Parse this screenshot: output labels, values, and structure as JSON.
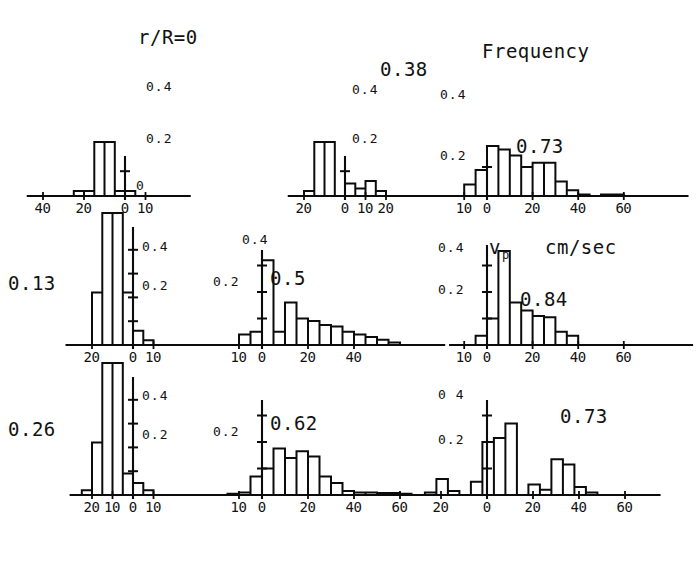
{
  "figure": {
    "title_top": "r/R=0",
    "frequency_label": "Frequency",
    "axis_symbol": "v",
    "axis_symbol_sub": "p",
    "axis_units": "cm/sec"
  },
  "chart_data": {
    "type": "bar",
    "xlabel": "v_p  cm/sec",
    "ylabel": "Frequency",
    "ylim": [
      0,
      0.5
    ],
    "grid": false,
    "legend": "none",
    "panels": [
      {
        "id": "panel-1",
        "label": "r/R=0",
        "row": 0,
        "col": 0,
        "xticks": [
          "40",
          "20",
          "0",
          "10"
        ],
        "xtick_values": [
          -40,
          -20,
          0,
          10
        ],
        "yticks": [
          "0",
          "0.2",
          "0.4"
        ],
        "ytick_values": [
          0,
          0.2,
          0.4
        ],
        "xlim": [
          -45,
          15
        ],
        "bin_width": 5,
        "bins_left": [
          -40,
          -35,
          -30,
          -25,
          -20,
          -15,
          -10,
          -5,
          0,
          5,
          10
        ],
        "values": [
          0.0,
          0.0,
          0.0,
          0.02,
          0.02,
          0.72,
          0.55,
          0.02,
          0.02,
          0.0,
          0.0
        ]
      },
      {
        "id": "panel-2",
        "label": "0.38",
        "row": 0,
        "col": 1,
        "xticks": [
          "20",
          "0",
          "10",
          "20"
        ],
        "xtick_values": [
          -20,
          0,
          10,
          20
        ],
        "yticks": [
          "0.2",
          "0.4"
        ],
        "ytick_values": [
          0.2,
          0.4
        ],
        "xlim": [
          -25,
          24
        ],
        "bin_width": 5,
        "bins_left": [
          -25,
          -20,
          -15,
          -10,
          -5,
          0,
          5,
          10,
          15,
          20
        ],
        "values": [
          0.0,
          0.02,
          0.56,
          0.4,
          0.0,
          0.05,
          0.03,
          0.06,
          0.02,
          0.0
        ]
      },
      {
        "id": "panel-3",
        "label": "0.73",
        "row": 0,
        "col": 2,
        "title": "Frequency",
        "xticks": [
          "10",
          "0",
          "20",
          "40",
          "60"
        ],
        "xtick_values": [
          -10,
          0,
          20,
          40,
          60
        ],
        "yticks": [
          "0.2",
          "0.4"
        ],
        "ytick_values": [
          0.2,
          0.4
        ],
        "xlim": [
          -16,
          78
        ],
        "bin_width": 5,
        "bins_left": [
          -15,
          -10,
          -5,
          0,
          5,
          10,
          15,
          20,
          25,
          30,
          35,
          40,
          45,
          50,
          55,
          60,
          65,
          70
        ],
        "values": [
          0.0,
          0.04,
          0.09,
          0.21,
          0.16,
          0.14,
          0.1,
          0.115,
          0.115,
          0.05,
          0.02,
          0.005,
          0.0,
          0.005,
          0.005,
          0.0,
          0.0,
          0.0
        ]
      },
      {
        "id": "panel-4",
        "label": "0.13",
        "row": 1,
        "col": 0,
        "xticks": [
          "20",
          "0",
          "10"
        ],
        "xtick_values": [
          -20,
          0,
          10
        ],
        "yticks": [
          "0.2",
          "0.4"
        ],
        "ytick_values": [
          0.2,
          0.4
        ],
        "xlim": [
          -30,
          14
        ],
        "bin_width": 5,
        "bins_left": [
          -30,
          -25,
          -20,
          -15,
          -10,
          -5,
          0,
          5,
          10
        ],
        "values": [
          0.0,
          0.0,
          0.22,
          0.62,
          0.6,
          0.22,
          0.06,
          0.02,
          0.0
        ]
      },
      {
        "id": "panel-5",
        "label": "0.5",
        "row": 1,
        "col": 1,
        "xticks": [
          "10",
          "0",
          "20",
          "40"
        ],
        "xtick_values": [
          -10,
          0,
          20,
          40
        ],
        "yticks": [
          "0.2",
          "0.4"
        ],
        "ytick_values": [
          0.2,
          0.4
        ],
        "xlim": [
          -16,
          62
        ],
        "bin_width": 5,
        "bins_left": [
          -15,
          -10,
          -5,
          0,
          5,
          10,
          15,
          20,
          25,
          30,
          35,
          40,
          45,
          50,
          55
        ],
        "values": [
          0.0,
          0.04,
          0.05,
          0.32,
          0.05,
          0.16,
          0.1,
          0.09,
          0.075,
          0.07,
          0.05,
          0.04,
          0.03,
          0.02,
          0.01
        ]
      },
      {
        "id": "panel-6",
        "label": "0.84",
        "row": 1,
        "col": 2,
        "xticks": [
          "10",
          "0",
          "20",
          "40",
          "60"
        ],
        "xtick_values": [
          -10,
          0,
          20,
          40,
          60
        ],
        "yticks": [
          "0.2",
          "0.4"
        ],
        "ytick_values": [
          0.2,
          0.4
        ],
        "xlim": [
          -14,
          78
        ],
        "bin_width": 5,
        "bins_left": [
          -15,
          -10,
          -5,
          0,
          5,
          10,
          15,
          20,
          25,
          30,
          35,
          40,
          45,
          50,
          55,
          60,
          65,
          70
        ],
        "values": [
          0.0,
          0.0,
          0.035,
          0.1,
          0.355,
          0.16,
          0.13,
          0.11,
          0.105,
          0.05,
          0.035,
          0.0,
          0.0,
          0.0,
          0.0,
          0.0,
          0.0,
          0.0
        ]
      },
      {
        "id": "panel-7",
        "label": "0.26",
        "row": 2,
        "col": 0,
        "xticks": [
          "20",
          "10",
          "0",
          "10"
        ],
        "xtick_values": [
          -20,
          -10,
          0,
          10
        ],
        "yticks": [
          "0.2",
          "0.4"
        ],
        "ytick_values": [
          0.2,
          0.4
        ],
        "xlim": [
          -28,
          16
        ],
        "bin_width": 5,
        "bins_left": [
          -25,
          -20,
          -15,
          -10,
          -5,
          0,
          5,
          10
        ],
        "values": [
          0.02,
          0.22,
          0.62,
          0.6,
          0.09,
          0.05,
          0.02,
          0.0
        ]
      },
      {
        "id": "panel-8",
        "label": "0.62",
        "row": 2,
        "col": 1,
        "xticks": [
          "10",
          "0",
          "20",
          "40",
          "60"
        ],
        "xtick_values": [
          -10,
          0,
          20,
          40,
          60
        ],
        "yticks": [
          "0.2"
        ],
        "ytick_values": [
          0.2
        ],
        "xlim": [
          -16,
          78
        ],
        "bin_width": 5,
        "bins_left": [
          -15,
          -10,
          -5,
          0,
          5,
          10,
          15,
          20,
          25,
          30,
          35,
          40,
          45,
          50,
          55,
          60,
          65,
          70
        ],
        "values": [
          0.005,
          0.01,
          0.07,
          0.1,
          0.175,
          0.14,
          0.165,
          0.145,
          0.07,
          0.045,
          0.015,
          0.01,
          0.01,
          0.008,
          0.008,
          0.005,
          0.0,
          0.0
        ]
      },
      {
        "id": "panel-9",
        "label": "0.73",
        "row": 2,
        "col": 2,
        "xticks": [
          "20",
          "0",
          "20",
          "40",
          "60"
        ],
        "xtick_values": [
          -20,
          0,
          20,
          40,
          60
        ],
        "yticks": [
          "0 4",
          "0.2"
        ],
        "ytick_values": [
          0.4,
          0.2
        ],
        "xlim": [
          -28,
          68
        ],
        "bin_width": 5,
        "bins_left": [
          -27,
          -22,
          -17,
          -12,
          -7,
          -2,
          3,
          8,
          13,
          18,
          23,
          28,
          33,
          38,
          43,
          48,
          53,
          58
        ],
        "values": [
          0.01,
          0.06,
          0.015,
          0.0,
          0.05,
          0.2,
          0.215,
          0.27,
          0.0,
          0.04,
          0.02,
          0.135,
          0.115,
          0.03,
          0.01,
          0.0,
          0.0,
          0.0
        ]
      }
    ]
  }
}
